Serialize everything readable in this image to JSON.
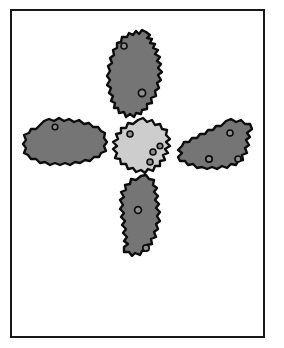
{
  "figure": {
    "title": "Cluster of five cells arranged in a cross pattern",
    "caption": "",
    "background_color": "#ffffff",
    "frame": {
      "name": "figure-frame",
      "stroke_color": "#18181a",
      "stroke_width": 2.5,
      "x": 10,
      "y": 9,
      "width": 255,
      "height": 329
    },
    "palette": {
      "outer_cell_fill": "#757575",
      "center_cell_fill": "#cdcdcd",
      "outline": "#0d0d0d",
      "nucleus_fill": "#8f8f8f",
      "nucleus_stroke": "#0d0d0d",
      "background": "#ffffff"
    },
    "cells": [
      {
        "id": "cell-top",
        "label": "Top cell",
        "fill": "#757575",
        "center": [
          138,
          70
        ],
        "orientation": "vertical",
        "spots": [
          {
            "id": "spot-top-1",
            "cx": 124,
            "cy": 46,
            "r": 3.0
          },
          {
            "id": "spot-top-2",
            "cx": 142,
            "cy": 93,
            "r": 3.6
          }
        ],
        "spot_count": 2
      },
      {
        "id": "cell-left",
        "label": "Left cell",
        "fill": "#757575",
        "center": [
          65,
          145
        ],
        "orientation": "horizontal",
        "spots": [
          {
            "id": "spot-left-1",
            "cx": 55,
            "cy": 127,
            "r": 2.8
          }
        ],
        "spot_count": 1
      },
      {
        "id": "cell-center",
        "label": "Center cell",
        "fill": "#cdcdcd",
        "center": [
          138,
          146
        ],
        "orientation": "round",
        "spots": [
          {
            "id": "spot-center-1",
            "cx": 130,
            "cy": 134,
            "r": 3.0
          },
          {
            "id": "spot-center-2",
            "cx": 160,
            "cy": 146,
            "r": 2.8
          },
          {
            "id": "spot-center-3",
            "cx": 153,
            "cy": 152,
            "r": 3.0
          },
          {
            "id": "spot-center-4",
            "cx": 150,
            "cy": 162,
            "r": 3.0
          }
        ],
        "spot_count": 4
      },
      {
        "id": "cell-right",
        "label": "Right cell",
        "fill": "#757575",
        "center": [
          211,
          144
        ],
        "orientation": "horizontal",
        "spots": [
          {
            "id": "spot-right-1",
            "cx": 230,
            "cy": 133,
            "r": 3.0
          },
          {
            "id": "spot-right-2",
            "cx": 209,
            "cy": 159,
            "r": 3.2
          },
          {
            "id": "spot-right-3",
            "cx": 238,
            "cy": 159,
            "r": 3.0
          }
        ],
        "spot_count": 3
      },
      {
        "id": "cell-bottom",
        "label": "Bottom cell",
        "fill": "#757575",
        "center": [
          142,
          214
        ],
        "orientation": "vertical",
        "spots": [
          {
            "id": "spot-bottom-1",
            "cx": 138,
            "cy": 210,
            "r": 3.4
          },
          {
            "id": "spot-bottom-2",
            "cx": 146,
            "cy": 248,
            "r": 3.2
          }
        ],
        "spot_count": 2
      }
    ],
    "cell_count": 5,
    "total_spot_count": 12
  }
}
